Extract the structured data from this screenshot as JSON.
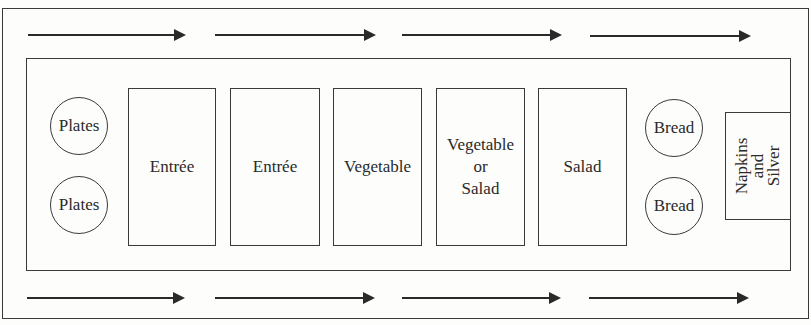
{
  "diagram": {
    "type": "buffet-line-layout",
    "flow_direction": "left-to-right",
    "arrows": {
      "top_row_count": 4,
      "bottom_row_count": 4
    },
    "stations": {
      "plates": [
        {
          "label": "Plates"
        },
        {
          "label": "Plates"
        }
      ],
      "dishes": [
        {
          "lines": [
            "Entrée"
          ]
        },
        {
          "lines": [
            "Entrée"
          ]
        },
        {
          "lines": [
            "Vegetable"
          ]
        },
        {
          "lines": [
            "Vegetable",
            "or",
            "Salad"
          ]
        },
        {
          "lines": [
            "Salad"
          ]
        }
      ],
      "bread": [
        {
          "label": "Bread"
        },
        {
          "label": "Bread"
        }
      ],
      "napkins": {
        "lines": [
          "Napkins",
          "and",
          "Silver"
        ]
      }
    }
  }
}
